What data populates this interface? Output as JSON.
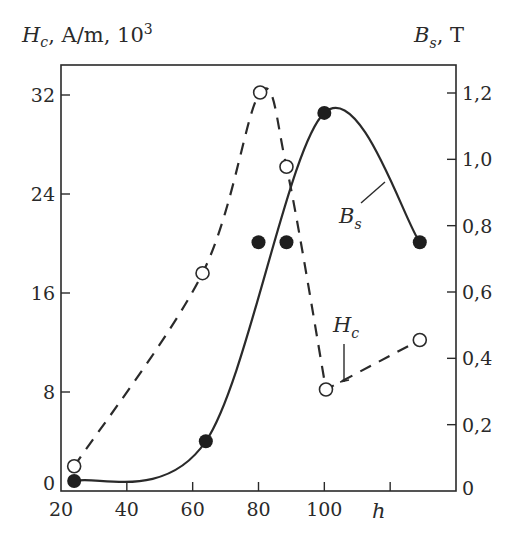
{
  "chart_data": {
    "type": "line",
    "title": "",
    "xlabel": "h",
    "ylabel_left": {
      "symbol": "H",
      "subscript": "c",
      "units": ", A/m, 10",
      "superscript": "3"
    },
    "ylabel_right": {
      "symbol": "B",
      "subscript": "s",
      "units": ",  T"
    },
    "xlim": [
      20,
      140
    ],
    "ylim_left": [
      0,
      35
    ],
    "ylim_right": [
      0,
      1.3
    ],
    "x_ticks": [
      20,
      40,
      60,
      80,
      100,
      120
    ],
    "x_tick_labels": [
      "20",
      "40",
      "60",
      "80",
      "100",
      ""
    ],
    "y_left_ticks": [
      0,
      8,
      16,
      24,
      32
    ],
    "y_left_tick_labels": [
      "0",
      "8",
      "16",
      "24",
      "32"
    ],
    "y_right_ticks": [
      0,
      0.2,
      0.4,
      0.6,
      0.8,
      1.0,
      1.2
    ],
    "y_right_tick_labels": [
      "0",
      "0,2",
      "0,4",
      "0,6",
      "0,8",
      "1,0",
      "1,2"
    ],
    "grid": false,
    "series": [
      {
        "name": "Hc",
        "label": {
          "symbol": "H",
          "subscript": "c"
        },
        "axis": "left",
        "style": "dashed",
        "marker": "open-circle",
        "x": [
          24,
          63,
          80.5,
          88.5,
          100.5,
          129
        ],
        "y": [
          2,
          17.6,
          32.2,
          26.2,
          8.2,
          12.2
        ]
      },
      {
        "name": "Bs",
        "label": {
          "symbol": "B",
          "subscript": "s"
        },
        "axis": "right",
        "style": "solid",
        "marker": "filled-circle",
        "x": [
          24,
          64,
          100,
          129
        ],
        "y": [
          0.03,
          0.15,
          1.14,
          0.75
        ]
      },
      {
        "name": "Bs-extra-points",
        "axis": "right",
        "style": "none",
        "marker": "filled-circle",
        "x": [
          80,
          88.5
        ],
        "y": [
          0.75,
          0.75
        ]
      }
    ]
  }
}
